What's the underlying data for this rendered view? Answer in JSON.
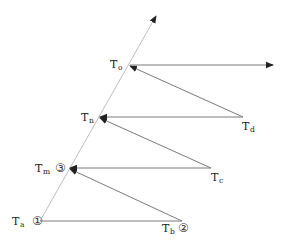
{
  "diagram": {
    "type": "timing-sequence",
    "nodes": {
      "Ta": {
        "base": "T",
        "sub": "a",
        "marker": "①"
      },
      "Tb": {
        "base": "T",
        "sub": "b",
        "marker": "②"
      },
      "Tm": {
        "base": "T",
        "sub": "m",
        "marker": "③"
      },
      "Tc": {
        "base": "T",
        "sub": "c",
        "marker": ""
      },
      "Tn": {
        "base": "T",
        "sub": "n",
        "marker": ""
      },
      "Td": {
        "base": "T",
        "sub": "d",
        "marker": ""
      },
      "To": {
        "base": "T",
        "sub": "o",
        "marker": ""
      }
    },
    "edges": [
      {
        "from": "Ta",
        "to": "Tb",
        "arrow": false
      },
      {
        "from": "Tb",
        "to": "Tm",
        "arrow": true
      },
      {
        "from": "Tc",
        "to": "Tm",
        "arrow": true
      },
      {
        "from": "Tc",
        "to": "Tn",
        "arrow": true
      },
      {
        "from": "Td",
        "to": "Tn",
        "arrow": true
      },
      {
        "from": "Td",
        "to": "To",
        "arrow": true
      },
      {
        "from": "To",
        "to": "out",
        "arrow": true
      },
      {
        "from": "Ta",
        "to": "axis-top",
        "arrow": true
      }
    ],
    "colors": {
      "line": "#7a7a7a",
      "axis": "#bdbdbd",
      "arrowhead": "#222222",
      "text": "#222222"
    }
  }
}
